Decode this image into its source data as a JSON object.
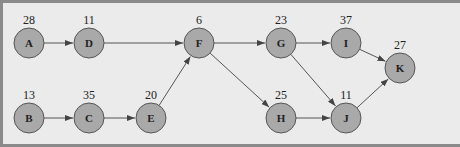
{
  "diagram": {
    "type": "directed-graph",
    "nodes": [
      {
        "id": "A",
        "label": "A",
        "weight": "28",
        "x": 29,
        "y": 43
      },
      {
        "id": "D",
        "label": "D",
        "weight": "11",
        "x": 89,
        "y": 43
      },
      {
        "id": "F",
        "label": "F",
        "weight": "6",
        "x": 199,
        "y": 43
      },
      {
        "id": "G",
        "label": "G",
        "weight": "23",
        "x": 281,
        "y": 43
      },
      {
        "id": "I",
        "label": "I",
        "weight": "37",
        "x": 346,
        "y": 43
      },
      {
        "id": "K",
        "label": "K",
        "weight": "27",
        "x": 400,
        "y": 68
      },
      {
        "id": "B",
        "label": "B",
        "weight": "13",
        "x": 29,
        "y": 118
      },
      {
        "id": "C",
        "label": "C",
        "weight": "35",
        "x": 89,
        "y": 118
      },
      {
        "id": "E",
        "label": "E",
        "weight": "20",
        "x": 151,
        "y": 118
      },
      {
        "id": "H",
        "label": "H",
        "weight": "25",
        "x": 281,
        "y": 118
      },
      {
        "id": "J",
        "label": "J",
        "weight": "11",
        "x": 346,
        "y": 118
      }
    ],
    "edges": [
      {
        "from": "A",
        "to": "D"
      },
      {
        "from": "D",
        "to": "F"
      },
      {
        "from": "B",
        "to": "C"
      },
      {
        "from": "C",
        "to": "E"
      },
      {
        "from": "E",
        "to": "F"
      },
      {
        "from": "F",
        "to": "G"
      },
      {
        "from": "F",
        "to": "H"
      },
      {
        "from": "G",
        "to": "I"
      },
      {
        "from": "G",
        "to": "J"
      },
      {
        "from": "H",
        "to": "J"
      },
      {
        "from": "I",
        "to": "K"
      },
      {
        "from": "J",
        "to": "K"
      }
    ],
    "node_radius": 15,
    "colors": {
      "background": "#ebebeb",
      "border": "#8a8a8a",
      "node_fill": "#a9a9a9",
      "node_stroke": "#555555",
      "edge": "#555555",
      "text": "#222222"
    }
  }
}
